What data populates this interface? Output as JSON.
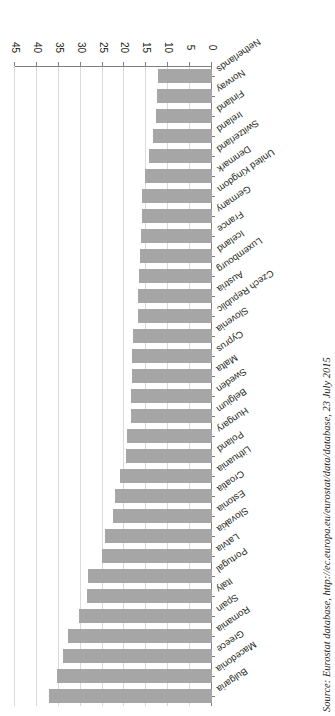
{
  "figure": {
    "orientation": "rotated-180",
    "bar_color": "#a6a6a6",
    "grid_color": "#d9d9d9",
    "axis_color": "#7f7f7f"
  },
  "source_note": {
    "text": "Source: Eurostat database, http://ec.europa.eu/eurostat/data/database, 23 July 2015"
  },
  "chart_data": {
    "type": "bar",
    "orientation": "horizontal",
    "title": "",
    "subtitle": "",
    "xlabel": "",
    "ylabel": "",
    "xlim": [
      0,
      45
    ],
    "xticks": [
      0,
      5,
      10,
      15,
      20,
      25,
      30,
      35,
      40,
      45
    ],
    "ticklabels": [
      "0",
      "5",
      "10",
      "15",
      "20",
      "25",
      "30",
      "35",
      "40",
      "45"
    ],
    "grid": true,
    "legend": false,
    "categories": [
      "Bulgaria",
      "Macedonia",
      "Greece",
      "Romania",
      "Spain",
      "Italy",
      "Portugal",
      "Latvia",
      "Slovakia",
      "Estonia",
      "Croatia",
      "Lithuania",
      "Poland",
      "Hungary",
      "Belgium",
      "Sweden",
      "Malta",
      "Cyprus",
      "Slovenia",
      "Czech Republic",
      "Austria",
      "Luxembourg",
      "Iceland",
      "France",
      "Germany",
      "United Kingdom",
      "Denmark",
      "Switzerland",
      "Ireland",
      "Finland",
      "Norway",
      "Netherlands"
    ],
    "values": [
      37.2,
      35.5,
      34.0,
      33.0,
      30.3,
      28.5,
      28.3,
      25.2,
      24.5,
      22.7,
      22.2,
      21.0,
      19.7,
      19.5,
      18.6,
      18.4,
      18.3,
      18.2,
      18.0,
      16.9,
      16.8,
      16.6,
      16.4,
      16.2,
      16.0,
      15.9,
      15.2,
      14.3,
      13.5,
      12.8,
      12.5,
      12.3
    ]
  }
}
